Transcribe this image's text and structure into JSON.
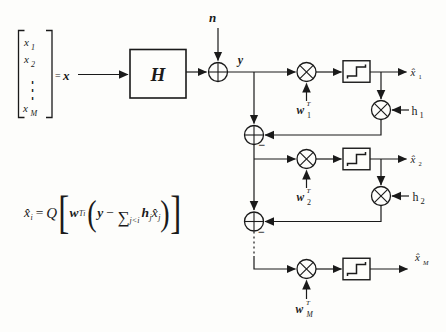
{
  "colors": {
    "ink": "#1a1a1a",
    "background": "#fdfdfb"
  },
  "vector": {
    "entry1_base": "x",
    "entry1_sub": "1",
    "entry2_base": "x",
    "entry2_sub": "2",
    "ellipsis": "⋮",
    "entryM_base": "x",
    "entryM_sub": "M",
    "equals": "=",
    "name": "x"
  },
  "channel": {
    "label": "H"
  },
  "noise": {
    "label": "n"
  },
  "received": {
    "label": "y"
  },
  "stage1": {
    "weight_base": "w",
    "weight_sup": "T",
    "weight_sub": "1",
    "feedback_base": "h",
    "feedback_sub": "1",
    "output_base": "x̂",
    "output_sub": "1",
    "minus": "−"
  },
  "stage2": {
    "weight_base": "w",
    "weight_sup": "T",
    "weight_sub": "2",
    "feedback_base": "h",
    "feedback_sub": "2",
    "output_base": "x̂",
    "output_sub": "2",
    "minus": "−"
  },
  "stageM": {
    "weight_base": "w",
    "weight_sup": "T",
    "weight_sub": "M",
    "output_base": "x̂",
    "output_sub": "M"
  },
  "equation": {
    "lhs_base": "x̂",
    "lhs_sub": "i",
    "equals": "=",
    "operator": "Q",
    "open_bracket": "[",
    "weight_base": "w",
    "weight_sup": "T",
    "weight_sub": "i",
    "open_paren": "(",
    "received": "y",
    "minus": "−",
    "sum": "∑",
    "sum_condition": "j<i",
    "feedback_base": "h",
    "feedback_sub": "j",
    "estimate_base": "x̂",
    "estimate_sub": "j",
    "close_paren": ")",
    "close_bracket": "]"
  }
}
